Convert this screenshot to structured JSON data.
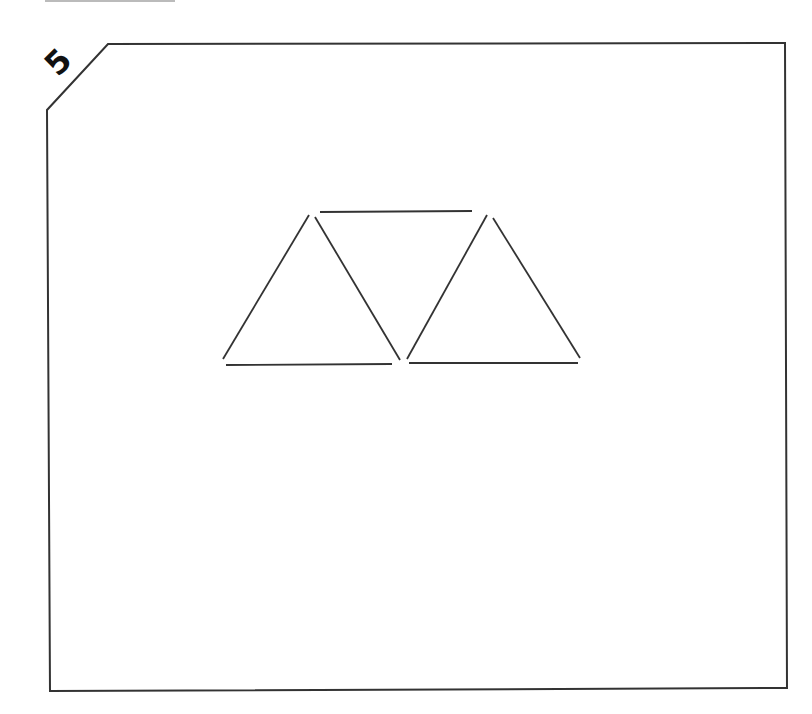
{
  "puzzle": {
    "number": "5",
    "frame": {
      "stroke": "#333333"
    },
    "stick_color": "#333333",
    "sticks": [
      {
        "id": "left-tri-left",
        "x1": 223,
        "y1": 359,
        "x2": 309,
        "y2": 215
      },
      {
        "id": "left-tri-right",
        "x1": 315,
        "y1": 217,
        "x2": 400,
        "y2": 360
      },
      {
        "id": "left-tri-bottom",
        "x1": 226,
        "y1": 365,
        "x2": 392,
        "y2": 364
      },
      {
        "id": "top-bar",
        "x1": 320,
        "y1": 212,
        "x2": 472,
        "y2": 211
      },
      {
        "id": "right-tri-left",
        "x1": 407,
        "y1": 359,
        "x2": 487,
        "y2": 215
      },
      {
        "id": "right-tri-right",
        "x1": 493,
        "y1": 218,
        "x2": 580,
        "y2": 358
      },
      {
        "id": "right-tri-bottom",
        "x1": 409,
        "y1": 363,
        "x2": 578,
        "y2": 363
      }
    ]
  }
}
